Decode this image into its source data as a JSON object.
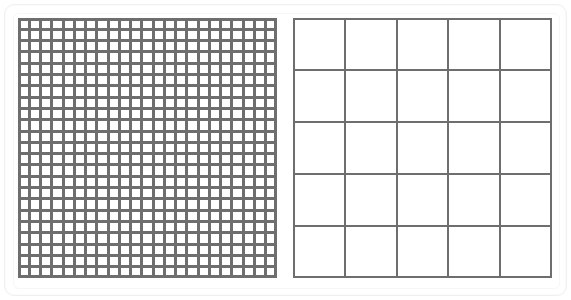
{
  "scene": {
    "title": "Grid Comparison",
    "background_color": "#ffffff",
    "frame_border_color": "#f0f0f0",
    "panel_count": 2
  },
  "panels": [
    {
      "name": "fine-grid",
      "label": "Fine Grid",
      "columns": 23,
      "rows": 23,
      "cell_size_px": 11.26,
      "line_width_px": 3,
      "line_color": "#6e6e6e",
      "cell_fill_color": "#ffffff",
      "x": 18,
      "y": 18,
      "width": 259,
      "height": 260
    },
    {
      "name": "coarse-grid",
      "label": "Coarse Grid",
      "columns": 5,
      "rows": 5,
      "cell_size_px": 51.8,
      "line_width_px": 2,
      "line_color": "#6e6e6e",
      "cell_fill_color": "#ffffff",
      "x": 293,
      "y": 18,
      "width": 259,
      "height": 260
    }
  ],
  "chart_data": {
    "type": "table",
    "xlabel": "",
    "ylabel": "",
    "categories": [
      "fine-grid",
      "coarse-grid"
    ],
    "series": [
      {
        "name": "columns",
        "values": [
          23,
          5
        ]
      },
      {
        "name": "rows",
        "values": [
          23,
          5
        ]
      },
      {
        "name": "total_cells",
        "values": [
          529,
          25
        ]
      },
      {
        "name": "cell_size_px",
        "values": [
          11.26,
          51.8
        ]
      },
      {
        "name": "line_width_px",
        "values": [
          3,
          2
        ]
      }
    ],
    "legend_position": "none",
    "grid": true
  }
}
